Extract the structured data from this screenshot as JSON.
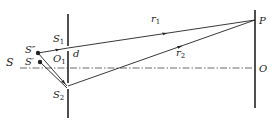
{
  "diagram": {
    "type": "double-slit interference geometry",
    "colors": {
      "line": "#222222",
      "background": "#ffffff"
    },
    "labels": {
      "S": "S",
      "S_double_prime": "S″",
      "S_prime": "S′",
      "S1": {
        "main": "S",
        "sub": "1"
      },
      "S2": {
        "main": "S",
        "sub": "2"
      },
      "O1": {
        "main": "O",
        "sub": "1"
      },
      "d": "d",
      "r1": {
        "main": "r",
        "sub": "1"
      },
      "r2": {
        "main": "r",
        "sub": "2"
      },
      "P": "P",
      "O": "O"
    }
  }
}
